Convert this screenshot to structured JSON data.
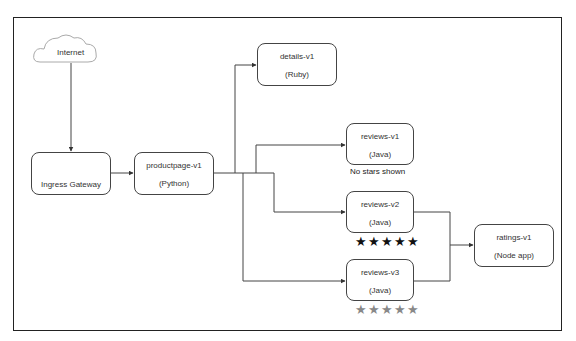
{
  "diagram": {
    "internet": {
      "label": "Internet"
    },
    "ingress": {
      "label": "Ingress Gateway"
    },
    "productpage": {
      "name": "productpage-v1",
      "lang": "(Python)"
    },
    "details": {
      "name": "details-v1",
      "lang": "(Ruby)"
    },
    "reviews_v1": {
      "name": "reviews-v1",
      "lang": "(Java)",
      "caption": "No stars shown"
    },
    "reviews_v2": {
      "name": "reviews-v2",
      "lang": "(Java)",
      "stars": "★★★★★",
      "star_color": "#111111"
    },
    "reviews_v3": {
      "name": "reviews-v3",
      "lang": "(Java)",
      "stars": "★★★★★",
      "star_color": "#888888"
    },
    "ratings": {
      "name": "ratings-v1",
      "lang": "(Node app)"
    }
  }
}
